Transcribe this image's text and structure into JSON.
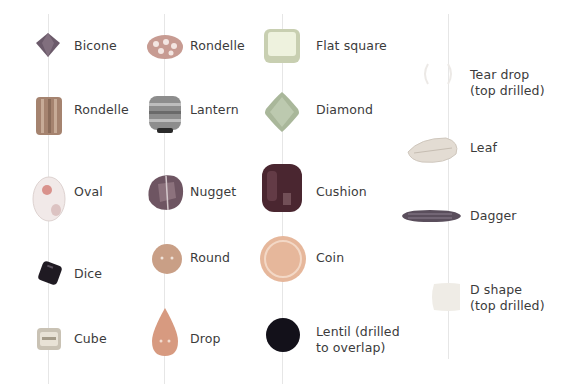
{
  "columns": [
    {
      "x": 48,
      "beads": [
        {
          "name": "Bicone",
          "label": "Bicone",
          "y": 46
        },
        {
          "name": "Cylinder",
          "label": "Cylinder",
          "y": 110
        },
        {
          "name": "Oval",
          "label": "Oval",
          "y": 192
        },
        {
          "name": "Dice",
          "label": "Dice",
          "y": 274
        },
        {
          "name": "Cube",
          "label": "Cube",
          "y": 339
        }
      ]
    },
    {
      "x": 164,
      "beads": [
        {
          "name": "Rondelle",
          "label": "Rondelle",
          "y": 46
        },
        {
          "name": "Lantern",
          "label": "Lantern",
          "y": 110
        },
        {
          "name": "Nugget",
          "label": "Nugget",
          "y": 192
        },
        {
          "name": "Round",
          "label": "Round",
          "y": 258
        },
        {
          "name": "Drop",
          "label": "Drop",
          "y": 339
        }
      ]
    },
    {
      "x": 282,
      "beads": [
        {
          "name": "Flat square",
          "label": "Flat square",
          "y": 46
        },
        {
          "name": "Diamond",
          "label": "Diamond",
          "y": 110
        },
        {
          "name": "Cushion",
          "label": "Cushion",
          "y": 192
        },
        {
          "name": "Coin",
          "label": "Coin",
          "y": 258
        },
        {
          "name": "Lentil",
          "label": "Lentil (drilled\nto overlap)",
          "y": 339
        }
      ]
    },
    {
      "x": 448,
      "beads": [
        {
          "name": "Tear drop",
          "label": "Tear drop\n(top drilled)",
          "y": 82
        },
        {
          "name": "Leaf",
          "label": "Leaf",
          "y": 148
        },
        {
          "name": "Dagger",
          "label": "Dagger",
          "y": 216
        },
        {
          "name": "D shape",
          "label": "D shape\n(top drilled)",
          "y": 296
        }
      ]
    }
  ],
  "colors": {
    "bicone": "#6b5a6a",
    "cylinder": "#a5836f",
    "oval": "#e7d9d7",
    "dice": "#1f1a22",
    "cube": "#c9c2b4",
    "rondelle": "#c79b92",
    "lantern": "#8d8d8d",
    "nugget": "#6e5562",
    "round": "#c99f86",
    "drop": "#d79a80",
    "flat_square": "#dde4c8",
    "diamond": "#a9b79a",
    "cushion": "#4a2630",
    "coin": "#e6b79b",
    "lentil": "#13111a",
    "tear_drop": "#f1f0ee",
    "leaf": "#e3dcd3",
    "dagger": "#5a4e5c",
    "d_shape": "#efece6",
    "thread": "#e6e6e6"
  }
}
